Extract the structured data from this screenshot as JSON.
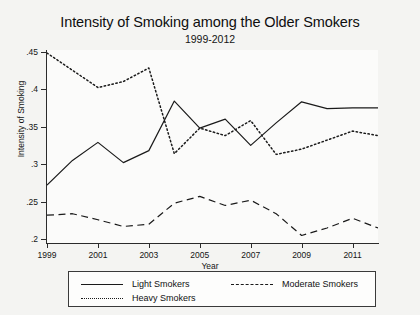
{
  "chart_data": {
    "type": "line",
    "title": "Intensity of Smoking among the Older Smokers",
    "subtitle": "1999-2012",
    "xlabel": "Year",
    "ylabel": "Intensity of Smoking",
    "x": [
      1999,
      2000,
      2001,
      2002,
      2003,
      2004,
      2005,
      2006,
      2007,
      2008,
      2009,
      2010,
      2011,
      2012
    ],
    "xlim": [
      1999,
      2012
    ],
    "ylim": [
      0.195,
      0.452
    ],
    "xticks": [
      "1999",
      "2001",
      "2003",
      "2005",
      "2007",
      "2009",
      "2011"
    ],
    "xtick_values": [
      1999,
      2001,
      2003,
      2005,
      2007,
      2009,
      2011
    ],
    "yticks": [
      ".45",
      ".4",
      ".35",
      ".3",
      ".25",
      ".2"
    ],
    "ytick_values": [
      0.45,
      0.4,
      0.35,
      0.3,
      0.25,
      0.2
    ],
    "grid": true,
    "legend_position": "below",
    "series": [
      {
        "name": "Light Smokers",
        "style": "solid",
        "color": "#1a1a1a",
        "values": [
          0.272,
          0.305,
          0.329,
          0.302,
          0.318,
          0.384,
          0.348,
          0.36,
          0.325,
          0.355,
          0.383,
          0.374,
          0.375,
          0.375
        ]
      },
      {
        "name": "Moderate Smokers",
        "style": "dashed",
        "color": "#1a1a1a",
        "values": [
          0.232,
          0.234,
          0.226,
          0.217,
          0.22,
          0.248,
          0.257,
          0.245,
          0.252,
          0.234,
          0.205,
          0.215,
          0.228,
          0.215
        ]
      },
      {
        "name": "Heavy Smokers",
        "style": "dotted",
        "color": "#1a1a1a",
        "values": [
          0.448,
          0.425,
          0.402,
          0.41,
          0.428,
          0.314,
          0.348,
          0.338,
          0.358,
          0.313,
          0.32,
          0.332,
          0.344,
          0.338
        ]
      }
    ]
  },
  "legend": {
    "items": [
      {
        "label": "Light Smokers",
        "style": "solid"
      },
      {
        "label": "Moderate Smokers",
        "style": "dashed"
      },
      {
        "label": "Heavy Smokers",
        "style": "dotted"
      }
    ]
  }
}
